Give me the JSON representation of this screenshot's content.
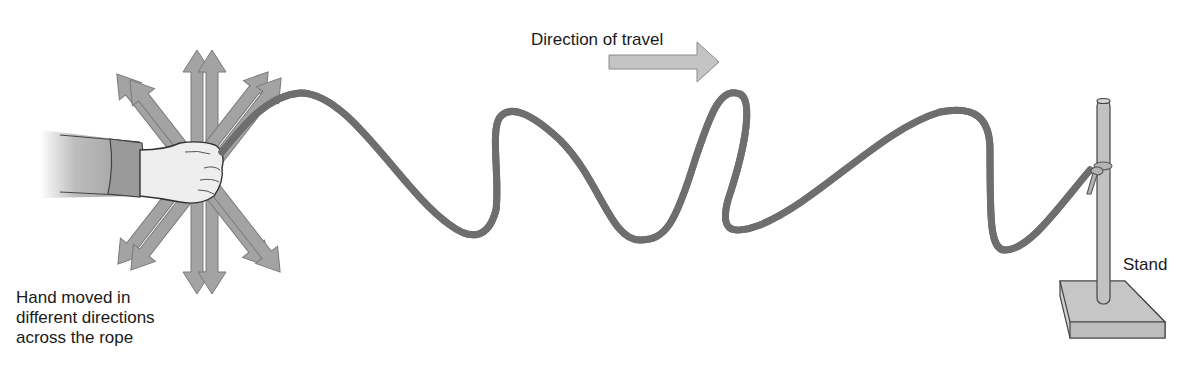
{
  "diagram": {
    "labels": {
      "direction": "Direction of travel",
      "stand": "Stand",
      "hand_line1": "Hand moved in",
      "hand_line2": "different directions",
      "hand_line3": "across the rope"
    },
    "elements": [
      "hand",
      "multi-direction-arrows",
      "rope-wave",
      "direction-arrow",
      "stand",
      "knot"
    ],
    "colors": {
      "rope": "#a8a8a8",
      "rope_outline": "#6e6e6e",
      "arrow_fill": "#a3a3a3",
      "arrow_outline": "#7a7a7a",
      "stand_fill": "#c8c8c8",
      "hand_fill": "#eeeeee",
      "sleeve": "#9a9a9a",
      "text": "#1a1a1a"
    }
  }
}
